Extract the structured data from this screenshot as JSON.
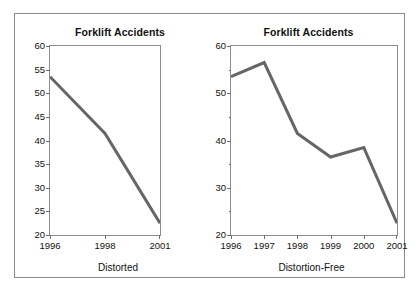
{
  "figure": {
    "background": "#ffffff",
    "border_color": "#8a8a8a",
    "line_color": "#666666",
    "axis_color": "#8e8e8e"
  },
  "chart_data": [
    {
      "id": "distorted",
      "type": "line",
      "title": "Forklift Accidents",
      "caption": "Distorted",
      "xlabel": "",
      "ylabel": "",
      "categories": [
        "1996",
        "1998",
        "2001"
      ],
      "x_tick_labels": [
        "1996",
        "1998",
        "2001"
      ],
      "values": [
        53.5,
        41.5,
        22.5
      ],
      "series": [
        {
          "name": "Forklift Accidents",
          "values": [
            53.5,
            41.5,
            22.5
          ]
        }
      ],
      "ylim": [
        20,
        60
      ],
      "y_tick_labels": [
        "20",
        "25",
        "30",
        "35",
        "40",
        "45",
        "50",
        "55",
        "60"
      ],
      "y_ticks": [
        20,
        25,
        30,
        35,
        40,
        45,
        50,
        55,
        60
      ],
      "y_minor_ticks": [],
      "grid": false,
      "legend": false,
      "legend_position": "none",
      "annotation": "X axis omits 1997, 1999 and 2000, so equal pixel spacing hides unequal time gaps — the decline looks smooth and linear."
    },
    {
      "id": "distortion-free",
      "type": "line",
      "title": "Forklift Accidents",
      "caption": "Distortion-Free",
      "xlabel": "",
      "ylabel": "",
      "categories": [
        "1996",
        "1997",
        "1998",
        "1999",
        "2000",
        "2001"
      ],
      "x_tick_labels": [
        "1996",
        "1997",
        "1998",
        "1999",
        "2000",
        "2001"
      ],
      "values": [
        53.5,
        56.5,
        41.5,
        36.5,
        38.5,
        22.5
      ],
      "series": [
        {
          "name": "Forklift Accidents",
          "values": [
            53.5,
            56.5,
            41.5,
            36.5,
            38.5,
            22.5
          ]
        }
      ],
      "ylim": [
        20,
        60
      ],
      "y_tick_labels": [
        "20",
        "30",
        "40",
        "50",
        "60"
      ],
      "y_ticks": [
        20,
        30,
        40,
        50,
        60
      ],
      "y_minor_ticks": [
        25,
        35,
        45,
        55
      ],
      "grid": false,
      "legend": false,
      "legend_position": "none",
      "annotation": "All six years shown at equal intervals, revealing the 1997 rise and the 2000 uptick."
    }
  ]
}
